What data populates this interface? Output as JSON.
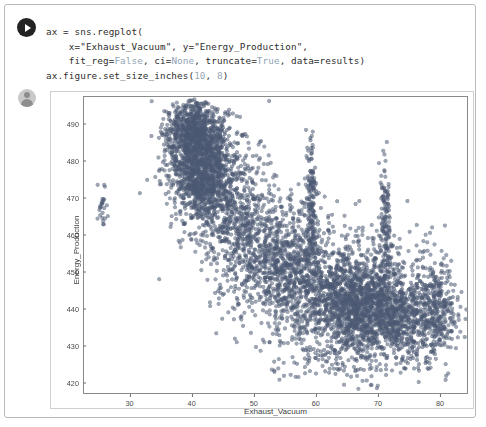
{
  "cell": {
    "run_icon": "play-icon",
    "avatar_icon": "user-avatar-icon",
    "code_lines": [
      [
        {
          "t": "ax = sns.regplot(",
          "c": "plain"
        }
      ],
      [
        {
          "t": "    x=\"Exhaust_Vacuum\", y=\"Energy_Production\",",
          "c": "plain"
        }
      ],
      [
        {
          "t": "    fit_reg=",
          "c": "plain"
        },
        {
          "t": "False",
          "c": "kw"
        },
        {
          "t": ", ci=",
          "c": "plain"
        },
        {
          "t": "None",
          "c": "kw"
        },
        {
          "t": ", truncate=",
          "c": "plain"
        },
        {
          "t": "True",
          "c": "kw"
        },
        {
          "t": ", data=results)",
          "c": "plain"
        }
      ],
      [
        {
          "t": "ax.figure.set_size_inches(",
          "c": "plain"
        },
        {
          "t": "10",
          "c": "num"
        },
        {
          "t": ", ",
          "c": "plain"
        },
        {
          "t": "8",
          "c": "num"
        },
        {
          "t": ")",
          "c": "plain"
        }
      ]
    ],
    "code_plain_text": "ax = sns.regplot(\n    x=\"Exhaust_Vacuum\", y=\"Energy_Production\",\n    fit_reg=False, ci=None, truncate=True, data=results)\nax.figure.set_size_inches(10, 8)"
  },
  "chart_data": {
    "type": "scatter",
    "title": "",
    "xlabel": "Exhaust_Vacuum",
    "ylabel": "Energy_Production",
    "xlim": [
      22.5,
      84.5
    ],
    "ylim": [
      417.0,
      497.5
    ],
    "xticks": [
      30,
      40,
      50,
      60,
      70,
      80
    ],
    "yticks": [
      420,
      430,
      440,
      450,
      460,
      470,
      480,
      490
    ],
    "grid": false,
    "legend": null,
    "marker": {
      "color": "#4c5a72",
      "size": 2.1,
      "alpha": 0.55
    },
    "clusters": [
      {
        "name": "isolated-low-vacuum",
        "n": 26,
        "x_mean": 25.5,
        "x_sd": 0.35,
        "y_mean": 467.5,
        "y_sd": 3.2
      },
      {
        "name": "high-output-core",
        "n": 1500,
        "x_mean": 41.5,
        "x_sd": 2.6,
        "y_mean": 478.5,
        "y_sd": 7.2
      },
      {
        "name": "upper-ridge",
        "n": 520,
        "x_mean": 40.2,
        "x_sd": 2.0,
        "y_mean": 489.0,
        "y_sd": 3.6
      },
      {
        "name": "mid-transition",
        "n": 620,
        "x_mean": 47.0,
        "x_sd": 3.4,
        "y_mean": 463.0,
        "y_sd": 9.5
      },
      {
        "name": "mid-band",
        "n": 900,
        "x_mean": 55.0,
        "x_sd": 4.0,
        "y_mean": 452.0,
        "y_sd": 8.0
      },
      {
        "name": "low-output-core",
        "n": 1700,
        "x_mean": 66.5,
        "x_sd": 5.2,
        "y_mean": 441.5,
        "y_sd": 7.0
      },
      {
        "name": "low-output-tail",
        "n": 700,
        "x_mean": 73.0,
        "x_sd": 4.4,
        "y_mean": 437.0,
        "y_sd": 6.0
      },
      {
        "name": "right-edge",
        "n": 240,
        "x_mean": 79.5,
        "x_sd": 1.8,
        "y_mean": 438.0,
        "y_sd": 7.5
      },
      {
        "name": "vertical-spike-59",
        "n": 180,
        "x_mean": 59.3,
        "x_sd": 0.45,
        "y_mean": 468.0,
        "y_sd": 9.0
      },
      {
        "name": "vertical-spike-71",
        "n": 140,
        "x_mean": 71.2,
        "x_sd": 0.5,
        "y_mean": 462.0,
        "y_sd": 8.5
      },
      {
        "name": "sparse-low-outliers",
        "n": 70,
        "x_mean": 63.0,
        "x_sd": 7.0,
        "y_mean": 425.5,
        "y_sd": 3.0
      },
      {
        "name": "sparse-upper-right",
        "n": 55,
        "x_mean": 70.0,
        "x_sd": 6.5,
        "y_mean": 455.0,
        "y_sd": 5.0
      }
    ]
  }
}
